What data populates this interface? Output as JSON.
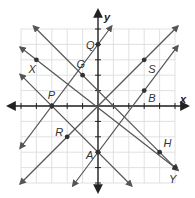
{
  "diagram": {
    "type": "coordinate-plane",
    "grid": {
      "x_range": [
        -5,
        5
      ],
      "y_range": [
        -5,
        5
      ],
      "unit_px": 15.4,
      "origin_px": [
        98,
        106
      ],
      "color": "#d9d9d9"
    },
    "axes": {
      "x_label": "x",
      "y_label": "y",
      "color": "#222222"
    },
    "line_color": "#555555",
    "point_color": "#333333",
    "points": [
      {
        "name": "Q",
        "x": 0,
        "y": 4
      },
      {
        "name": "S",
        "x": 3,
        "y": 3
      },
      {
        "name": "G",
        "x": -1,
        "y": 2
      },
      {
        "name": "X",
        "x": -4,
        "y": 3
      },
      {
        "name": "P",
        "x": -3,
        "y": 0
      },
      {
        "name": "B",
        "x": 3,
        "y": 1
      },
      {
        "name": "R",
        "x": -2,
        "y": -2
      },
      {
        "name": "A",
        "x": 0,
        "y": -3
      },
      {
        "name": "H",
        "x": 4,
        "y": -3
      },
      {
        "name": "Y",
        "x": 5,
        "y": -4
      }
    ],
    "lines": [
      {
        "name": "line-PQ",
        "through": [
          "P",
          "Q"
        ]
      },
      {
        "name": "line-RS",
        "through": [
          "R",
          "S"
        ]
      },
      {
        "name": "line-AB",
        "through": [
          "A",
          "B"
        ]
      },
      {
        "name": "line-GH",
        "through": [
          "G",
          "H"
        ]
      },
      {
        "name": "line-XY",
        "through": [
          "X",
          "Y"
        ]
      },
      {
        "name": "line-PA",
        "through": [
          "P",
          "A"
        ]
      }
    ]
  }
}
